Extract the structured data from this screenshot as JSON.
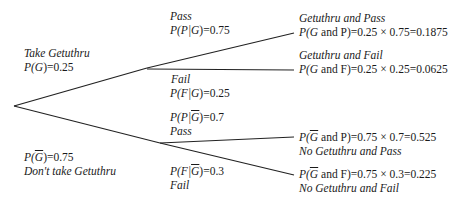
{
  "diagram": {
    "type": "probability-tree",
    "line_color": "#222222",
    "first_stage": {
      "take": {
        "label": "Take Getuthru",
        "prob_prefix": "P(",
        "prob_var": "G",
        "prob_suffix": ")=0.25"
      },
      "not_take": {
        "label": "Don't take Getuthru",
        "prob_prefix": "P(",
        "prob_var": "G",
        "prob_suffix": ")=0.75"
      }
    },
    "second_stage": {
      "g_pass": {
        "label": "Pass",
        "prob_prefix": "P(P|",
        "prob_var": "G",
        "prob_suffix": ")=0.75"
      },
      "g_fail": {
        "label": "Fail",
        "prob_prefix": "P(F|",
        "prob_var": "G",
        "prob_suffix": ")=0.25"
      },
      "ng_pass": {
        "label": "Pass",
        "prob_prefix": "P(P|",
        "prob_var": "G",
        "prob_suffix": ")=0.7"
      },
      "ng_fail": {
        "label": "Fail",
        "prob_prefix": "P(F|",
        "prob_var": "G",
        "prob_suffix": ")=0.3"
      }
    },
    "outcomes": [
      {
        "label": "Getuthru and Pass",
        "formula_prefix": "P(",
        "formula_var": "G",
        "formula_suffix": " and P)=0.25 × 0.75=0.1875"
      },
      {
        "label": "Getuthru and Fail",
        "formula_prefix": "P(",
        "formula_var": "G",
        "formula_suffix": " and F)=0.25 × 0.25=0.0625"
      },
      {
        "label": "No Getuthru and Pass",
        "formula_prefix": "P(",
        "formula_var": "G",
        "formula_suffix": " and P)=0.75 × 0.7=0.525"
      },
      {
        "label": "No Getuthru and Fail",
        "formula_prefix": "P(",
        "formula_var": "G",
        "formula_suffix": " and F)=0.75 × 0.3=0.225"
      }
    ]
  }
}
